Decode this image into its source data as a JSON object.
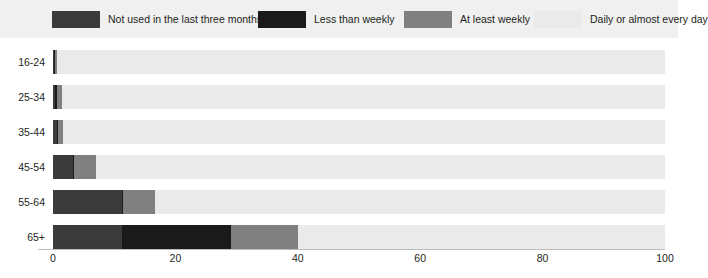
{
  "chart_data": {
    "type": "bar",
    "orientation": "horizontal",
    "stacked": true,
    "stacked_percent": true,
    "title": "",
    "subtitle": "",
    "xlabel": "",
    "ylabel": "",
    "xlim": [
      0,
      100
    ],
    "xticks": [
      0,
      20,
      40,
      60,
      80,
      100
    ],
    "xtick_labels": [
      "0",
      "20",
      "40",
      "60",
      "80",
      "100"
    ],
    "grid": false,
    "legend_position": "top",
    "categories": [
      "16-24",
      "25-34",
      "35-44",
      "45-54",
      "55-64",
      "65+"
    ],
    "series": [
      {
        "name": "Not used in the last three months",
        "color": "#3b3b3b",
        "values": [
          0.2,
          0.3,
          0.7,
          3.3,
          11.3,
          11.3
        ]
      },
      {
        "name": "Less than weekly",
        "color": "#1a1a1a",
        "values": [
          0.2,
          0.3,
          0.1,
          0.1,
          0.1,
          17.8
        ]
      },
      {
        "name": "At least weekly",
        "color": "#808080",
        "values": [
          0.3,
          0.8,
          0.8,
          3.6,
          5.2,
          11.0
        ]
      },
      {
        "name": "Daily or almost every day",
        "color": "#eaeaea",
        "values": [
          99.3,
          98.6,
          98.4,
          93.0,
          83.4,
          59.9
        ]
      }
    ]
  },
  "legend": {
    "items": [
      {
        "label": "Not used in the last three months",
        "color": "#3b3b3b"
      },
      {
        "label": "Less than weekly",
        "color": "#1a1a1a"
      },
      {
        "label": "At least weekly",
        "color": "#808080"
      },
      {
        "label": "Daily or almost every day",
        "color": "#eaeaea"
      }
    ],
    "background": "#f0f0f0"
  },
  "axis": {
    "x_tick_labels": [
      "0",
      "20",
      "40",
      "60",
      "80",
      "100"
    ],
    "y_tick_labels": [
      "16-24",
      "25-34",
      "35-44",
      "45-54",
      "55-64",
      "65+"
    ],
    "line_color": "#bcbcbc"
  }
}
